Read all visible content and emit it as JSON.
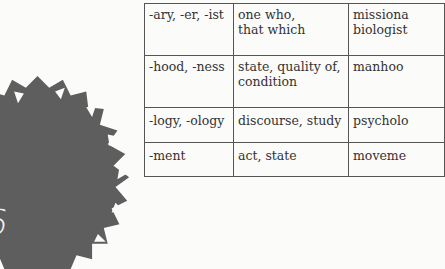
{
  "badge": {
    "number": "6",
    "fill_color": "#5e5e5e",
    "notch_color": "#ffffff"
  },
  "table": {
    "rows": [
      {
        "suffix": "-ary, -er, -ist",
        "meaning": [
          "one who,",
          "that which"
        ],
        "example": [
          "missiona",
          "biologist"
        ]
      },
      {
        "suffix": "-hood, -ness",
        "meaning": [
          "state, quality of,",
          "condition"
        ],
        "example": [
          "manhoo"
        ]
      },
      {
        "suffix": "-logy, -ology",
        "meaning": [
          "discourse, study"
        ],
        "example": [
          "psycholo"
        ]
      },
      {
        "suffix": "-ment",
        "meaning": [
          "act, state"
        ],
        "example": [
          "moveme"
        ]
      }
    ]
  }
}
